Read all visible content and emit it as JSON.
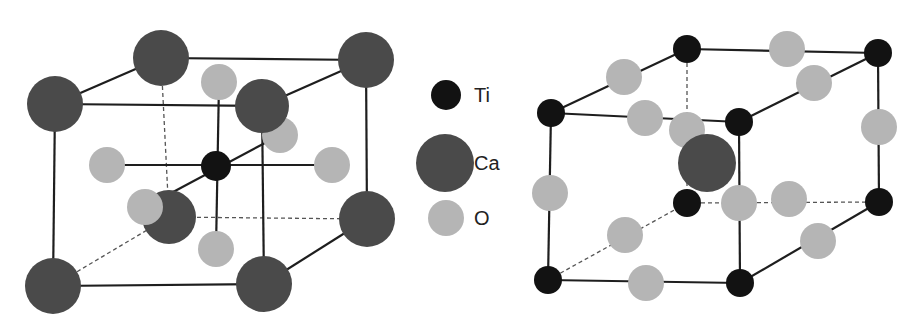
{
  "colors": {
    "Ti": "#121212",
    "Ca": "#4a4a4a",
    "O": "#b5b5b5",
    "line": "#1e1e1e",
    "dashed": "#555555"
  },
  "legend": {
    "items": [
      {
        "label": "Ti",
        "cx": 446,
        "cy": 95,
        "r": 15,
        "species": "Ti"
      },
      {
        "label": "Ca",
        "cx": 445,
        "cy": 163,
        "r": 29,
        "species": "Ca"
      },
      {
        "label": "O",
        "cx": 446,
        "cy": 218,
        "r": 18,
        "species": "O"
      }
    ]
  },
  "left_cell": {
    "description": "Ca-centered corners, Ti body center, O face centers",
    "solid_edges": [
      [
        161,
        58,
        366,
        60
      ],
      [
        55,
        104,
        262,
        106
      ],
      [
        55,
        104,
        161,
        58
      ],
      [
        262,
        106,
        366,
        60
      ],
      [
        55,
        104,
        53,
        286
      ],
      [
        262,
        106,
        264,
        284
      ],
      [
        366,
        60,
        367,
        219
      ],
      [
        53,
        286,
        264,
        284
      ],
      [
        264,
        284,
        367,
        219
      ],
      [
        107,
        165,
        332,
        165
      ],
      [
        219,
        82,
        216,
        249
      ],
      [
        145,
        207,
        280,
        135
      ]
    ],
    "dashed_edges": [
      [
        161,
        58,
        169,
        217
      ],
      [
        169,
        217,
        367,
        219
      ],
      [
        53,
        286,
        169,
        217
      ]
    ],
    "atoms": [
      {
        "species": "Ca",
        "cx": 161,
        "cy": 58,
        "r": 28
      },
      {
        "species": "Ca",
        "cx": 366,
        "cy": 60,
        "r": 28
      },
      {
        "species": "O",
        "cx": 219,
        "cy": 82,
        "r": 18
      },
      {
        "species": "O",
        "cx": 280,
        "cy": 135,
        "r": 18
      },
      {
        "species": "Ca",
        "cx": 55,
        "cy": 104,
        "r": 28
      },
      {
        "species": "Ca",
        "cx": 262,
        "cy": 106,
        "r": 27
      },
      {
        "species": "Ca",
        "cx": 169,
        "cy": 217,
        "r": 27
      },
      {
        "species": "Ca",
        "cx": 367,
        "cy": 219,
        "r": 28
      },
      {
        "species": "O",
        "cx": 107,
        "cy": 165,
        "r": 18
      },
      {
        "species": "O",
        "cx": 332,
        "cy": 165,
        "r": 18
      },
      {
        "species": "Ti",
        "cx": 216,
        "cy": 166,
        "r": 15
      },
      {
        "species": "O",
        "cx": 145,
        "cy": 207,
        "r": 18
      },
      {
        "species": "O",
        "cx": 216,
        "cy": 249,
        "r": 18
      },
      {
        "species": "Ca",
        "cx": 53,
        "cy": 286,
        "r": 28
      },
      {
        "species": "Ca",
        "cx": 264,
        "cy": 284,
        "r": 28
      }
    ]
  },
  "right_cell": {
    "description": "Ti corners, Ca body center, O edge centers",
    "solid_edges": [
      [
        687,
        49,
        878,
        53
      ],
      [
        551,
        113,
        739,
        122
      ],
      [
        551,
        113,
        687,
        49
      ],
      [
        739,
        122,
        878,
        53
      ],
      [
        551,
        113,
        548,
        280
      ],
      [
        739,
        122,
        740,
        283
      ],
      [
        878,
        53,
        879,
        202
      ],
      [
        548,
        280,
        740,
        283
      ],
      [
        740,
        283,
        879,
        202
      ]
    ],
    "dashed_edges": [
      [
        687,
        49,
        687,
        203
      ],
      [
        687,
        203,
        879,
        202
      ],
      [
        548,
        280,
        687,
        203
      ]
    ],
    "atoms": [
      {
        "species": "O",
        "cx": 687,
        "cy": 130,
        "r": 18
      },
      {
        "species": "O",
        "cx": 789,
        "cy": 199,
        "r": 18
      },
      {
        "species": "O",
        "cx": 625,
        "cy": 235,
        "r": 18
      },
      {
        "species": "Ti",
        "cx": 687,
        "cy": 203,
        "r": 14
      },
      {
        "species": "Ti",
        "cx": 879,
        "cy": 202,
        "r": 14
      },
      {
        "species": "Ca",
        "cx": 707,
        "cy": 163,
        "r": 29
      },
      {
        "species": "Ti",
        "cx": 687,
        "cy": 49,
        "r": 14
      },
      {
        "species": "O",
        "cx": 787,
        "cy": 49,
        "r": 18
      },
      {
        "species": "Ti",
        "cx": 878,
        "cy": 53,
        "r": 14
      },
      {
        "species": "O",
        "cx": 624,
        "cy": 77,
        "r": 18
      },
      {
        "species": "O",
        "cx": 814,
        "cy": 83,
        "r": 18
      },
      {
        "species": "Ti",
        "cx": 551,
        "cy": 113,
        "r": 14
      },
      {
        "species": "O",
        "cx": 645,
        "cy": 118,
        "r": 18
      },
      {
        "species": "Ti",
        "cx": 739,
        "cy": 122,
        "r": 14
      },
      {
        "species": "O",
        "cx": 879,
        "cy": 127,
        "r": 18
      },
      {
        "species": "O",
        "cx": 550,
        "cy": 193,
        "r": 18
      },
      {
        "species": "O",
        "cx": 739,
        "cy": 203,
        "r": 18
      },
      {
        "species": "O",
        "cx": 818,
        "cy": 241,
        "r": 18
      },
      {
        "species": "Ti",
        "cx": 548,
        "cy": 280,
        "r": 14
      },
      {
        "species": "O",
        "cx": 646,
        "cy": 283,
        "r": 18
      },
      {
        "species": "Ti",
        "cx": 740,
        "cy": 283,
        "r": 14
      }
    ]
  }
}
